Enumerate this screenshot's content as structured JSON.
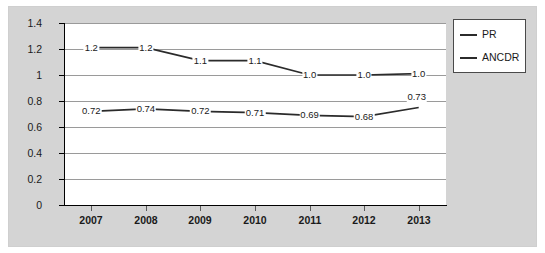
{
  "chart_data": {
    "type": "line",
    "title": "",
    "xlabel": "",
    "ylabel": "",
    "categories": [
      "2007",
      "2008",
      "2009",
      "2010",
      "2011",
      "2012",
      "2013"
    ],
    "ylim": [
      0,
      1.4
    ],
    "ytick_labels": [
      "1.4",
      "1.2",
      "1",
      "0.8",
      "0.6",
      "0.4",
      "0.2",
      "0"
    ],
    "ytick_values": [
      1.4,
      1.2,
      1,
      0.8,
      0.6,
      0.4,
      0.2,
      0
    ],
    "grid": true,
    "legend_position": "right",
    "series": [
      {
        "name": "PR",
        "values": [
          1.2,
          1.2,
          1.1,
          1.1,
          1.0,
          1.0,
          1.0
        ],
        "plot_values": [
          1.21,
          1.21,
          1.11,
          1.11,
          1.0,
          1.0,
          1.01
        ],
        "labels": [
          "1.2",
          "1.2",
          "1.1",
          "1.1",
          "1.0",
          "1.0",
          "1.0"
        ],
        "color": "#2b2b2b"
      },
      {
        "name": "ANCDR",
        "values": [
          0.72,
          0.74,
          0.72,
          0.71,
          0.69,
          0.68,
          0.73
        ],
        "plot_values": [
          0.72,
          0.74,
          0.72,
          0.71,
          0.69,
          0.68,
          0.75
        ],
        "labels": [
          "0.72",
          "0.74",
          "0.72",
          "0.71",
          "0.69",
          "0.68",
          "0.73"
        ],
        "color": "#2b2b2b"
      }
    ]
  },
  "legend": {
    "entries": [
      {
        "label": "PR"
      },
      {
        "label": "ANCDR"
      }
    ]
  },
  "colors": {
    "chart_background": "#d4d4d4",
    "plot_background": "#ffffff",
    "gridline": "#9a9a9a",
    "axis": "#000000",
    "series_line": "#2b2b2b"
  }
}
